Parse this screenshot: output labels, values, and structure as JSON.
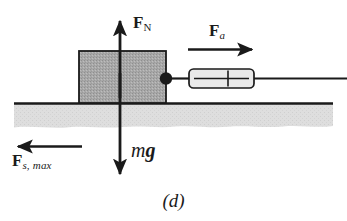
{
  "figure": {
    "caption": "(d)",
    "colors": {
      "ink": "#1a1a1a",
      "block_fill": "#a8a8a8",
      "ground_fill": "#dcdcdc",
      "scale_fill": "#e8e8e8",
      "background": "#ffffff"
    }
  },
  "labels": {
    "normal_force": {
      "symbol": "F",
      "subscript": "N",
      "text": "F_N"
    },
    "applied_force": {
      "symbol": "F",
      "subscript": "a",
      "text": "F_a"
    },
    "static_friction_max": {
      "symbol": "F",
      "subscript": "s, max",
      "text": "F_s, max"
    },
    "weight": {
      "mass": "m",
      "gravity": "g",
      "text": "mg"
    }
  },
  "objects": {
    "block": {
      "name": "block"
    },
    "ground": {
      "name": "ground-surface"
    },
    "spring_scale": {
      "name": "spring-scale"
    },
    "cord": {
      "name": "cord"
    },
    "attachment_point": {
      "name": "attachment-dot"
    }
  },
  "vectors": [
    {
      "name": "normal-force-arrow",
      "label": "F_N",
      "direction": "up"
    },
    {
      "name": "weight-arrow",
      "label": "mg",
      "direction": "down"
    },
    {
      "name": "applied-force-arrow",
      "label": "F_a",
      "direction": "right"
    },
    {
      "name": "static-friction-arrow",
      "label": "F_s, max",
      "direction": "left"
    }
  ]
}
